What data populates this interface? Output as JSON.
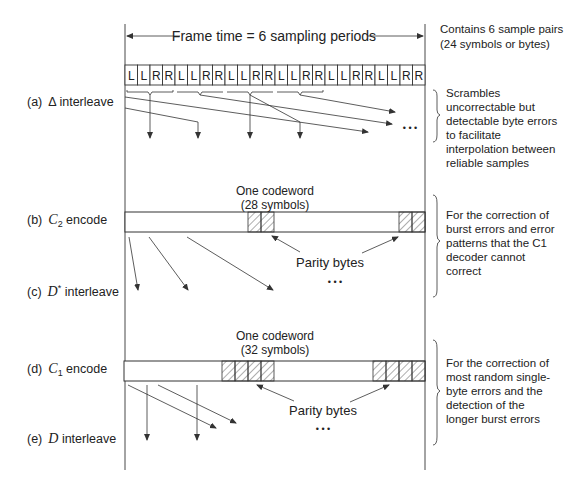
{
  "diagram": {
    "frame_label": "Frame time = 6 sampling periods",
    "frame_note": [
      "Contains 6 sample pairs",
      "(24 symbols or bytes)"
    ],
    "symbols": [
      "L",
      "L",
      "R",
      "R",
      "L",
      "L",
      "R",
      "R",
      "L",
      "L",
      "R",
      "R",
      "L",
      "L",
      "R",
      "R",
      "L",
      "L",
      "R",
      "R",
      "L",
      "L",
      "R",
      "R"
    ],
    "stages": [
      {
        "id": "a",
        "prefix": "(a)",
        "math": "Δ",
        "sub": "",
        "sup": "",
        "suffix": " interleave"
      },
      {
        "id": "b",
        "prefix": "(b)",
        "math": "C",
        "sub": "2",
        "sup": "",
        "suffix": " encode"
      },
      {
        "id": "c",
        "prefix": "(c)",
        "math": "D",
        "sub": "",
        "sup": "*",
        "suffix": " interleave"
      },
      {
        "id": "d",
        "prefix": "(d)",
        "math": "C",
        "sub": "1",
        "sup": "",
        "suffix": " encode"
      },
      {
        "id": "e",
        "prefix": "(e)",
        "math": "D",
        "sub": "",
        "sup": "",
        "suffix": " interleave"
      }
    ],
    "codeword_c2": {
      "title": "One codeword",
      "subtitle": "(28 symbols)",
      "parity_label": "Parity bytes",
      "ellipsis": "• • •"
    },
    "codeword_c1": {
      "title": "One codeword",
      "subtitle": "(32 symbols)",
      "parity_label": "Parity bytes",
      "ellipsis": "• • •"
    },
    "ellipsis_a": "• • •",
    "notes": {
      "a": [
        "Scrambles",
        "uncorrectable but",
        "detectable byte errors",
        "to facilitate",
        "interpolation between",
        "reliable samples"
      ],
      "b": [
        "For the correction of",
        "burst errors and error",
        "patterns that the C1",
        "decoder cannot",
        "correct"
      ],
      "d": [
        "For the correction of",
        "most random single-",
        "byte errors and the",
        "detection of the",
        "longer burst errors"
      ]
    },
    "colors": {
      "line": "#333333",
      "text": "#222222",
      "background": "#ffffff"
    }
  }
}
